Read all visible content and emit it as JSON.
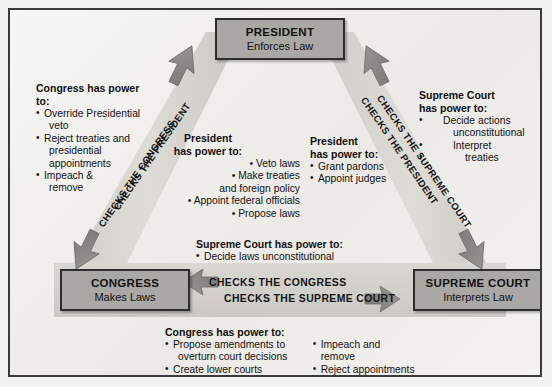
{
  "diagram": {
    "type": "separation-of-powers-triangle",
    "colors": {
      "box_fill": "#a9a8a4",
      "box_border": "#2d2d2d",
      "band_fill": "#d8d6d1",
      "arrow_fill": "#8e8d89",
      "frame_border": "#3b3b3b",
      "background": "#f2f2f0",
      "text": "#111111"
    }
  },
  "boxes": {
    "president": {
      "name": "PRESIDENT",
      "role": "Enforces Law"
    },
    "congress": {
      "name": "CONGRESS",
      "role": "Makes Laws"
    },
    "supreme_court": {
      "name": "SUPREME COURT",
      "role": "Interprets Law"
    }
  },
  "band_labels": {
    "left_diagonal": {
      "upper": "CHECKS THE PRESIDENT",
      "lower": "CHECKS THE CONGRESS"
    },
    "right_diagonal": {
      "upper": "CHECKS THE PRESIDENT",
      "lower": "CHECKS THE SUPREME COURT"
    },
    "bottom_horizontal": {
      "upper": "CHECKS THE CONGRESS",
      "lower": "CHECKS THE SUPREME COURT"
    }
  },
  "power_blocks": {
    "congress_over_president": {
      "heading": "Congress has power to:",
      "items": [
        {
          "text": "Override Presidential",
          "bullet": true
        },
        {
          "text": "veto",
          "bullet": false
        },
        {
          "text": "Reject treaties and",
          "bullet": true
        },
        {
          "text": "presidential",
          "bullet": false
        },
        {
          "text": "appointments",
          "bullet": false
        },
        {
          "text": "Impeach &",
          "bullet": true
        },
        {
          "text": "remove",
          "bullet": false
        }
      ]
    },
    "president_over_congress": {
      "heading_line1": "President",
      "heading_line2": "has power to:",
      "items": [
        "• Veto laws",
        "• Make treaties",
        "and foreign policy",
        "• Appoint federal officials",
        "• Propose laws"
      ]
    },
    "president_over_court": {
      "heading_line1": "President",
      "heading_line2": "has power to:",
      "items": [
        "Grant pardons",
        "Appoint judges"
      ]
    },
    "court_over_president": {
      "heading_line1": "Supreme Court",
      "heading_line2": "has power to:",
      "items": [
        {
          "text": "Decide actions",
          "bullet": true,
          "indent": 1
        },
        {
          "text": "unconstitutional",
          "bullet": false,
          "indent": 1
        },
        {
          "text": "Interpret",
          "bullet": true,
          "indent": 2
        },
        {
          "text": "treaties",
          "bullet": false,
          "indent": 2
        }
      ]
    },
    "court_over_congress": {
      "heading": "Supreme Court has power to:",
      "items": [
        "Decide laws unconstitutional"
      ]
    },
    "congress_over_court": {
      "heading": "Congress has power to:",
      "column1": [
        {
          "text": "Propose amendments to",
          "bullet": true
        },
        {
          "text": "overturn court decisions",
          "bullet": false
        },
        {
          "text": "Create lower courts",
          "bullet": true
        }
      ],
      "column2": [
        {
          "text": "Impeach and remove",
          "bullet": true
        },
        {
          "text": "Reject appointments",
          "bullet": true
        }
      ]
    }
  }
}
